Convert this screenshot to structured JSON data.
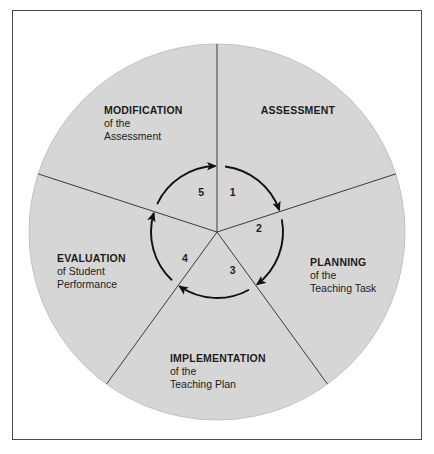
{
  "diagram": {
    "shape": "circle-five-sectors",
    "colors": {
      "circle_fill": "#d6d6d6",
      "circle_edge": "#c2c2c2",
      "divider_line": "#3a3a3a",
      "arrow": "#111111",
      "text": "#1c1c1c",
      "frame_border": "#4a4a4a",
      "page_background": "#ffffff"
    },
    "geometry": {
      "center_x": 217,
      "center_y": 232,
      "outer_radius": 188,
      "inner_arc_radius": 66,
      "number_radius": 42
    },
    "sectors": [
      {
        "number": "1",
        "title": "ASSESSMENT",
        "sub_lines": [],
        "label_x": 298,
        "label_y": 104,
        "align": "center",
        "number_angle_deg": -68
      },
      {
        "number": "2",
        "title": "PLANNING",
        "sub_lines": [
          "of the",
          "Teaching Task"
        ],
        "label_x": 310,
        "label_y": 256,
        "align": "left",
        "number_angle_deg": -4
      },
      {
        "number": "3",
        "title": "IMPLEMENTATION",
        "sub_lines": [
          "of the",
          "Teaching Plan"
        ],
        "label_x": 170,
        "label_y": 352,
        "align": "left",
        "number_angle_deg": 68
      },
      {
        "number": "4",
        "title": "EVALUATION",
        "sub_lines": [
          "of Student",
          "Performance"
        ],
        "label_x": 57,
        "label_y": 252,
        "align": "left",
        "number_angle_deg": 140
      },
      {
        "number": "5",
        "title": "MODIFICATION",
        "sub_lines": [
          "of the",
          "Assessment"
        ],
        "label_x": 104,
        "label_y": 104,
        "align": "left",
        "number_angle_deg": -112
      }
    ],
    "dividers_deg": [
      -90,
      -18,
      54,
      126,
      198
    ],
    "arrow_direction": "clockwise",
    "arrow_count": 5
  }
}
